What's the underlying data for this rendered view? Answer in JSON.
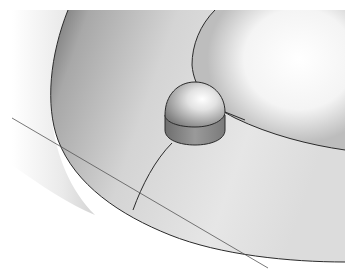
{
  "scene": {
    "description": "3D shaded render of a torus segment with a dome-capped cylinder knob",
    "colors": {
      "background": "#ffffff",
      "torus_light": "#f2f2f2",
      "torus_mid": "#c8c8c8",
      "torus_dark": "#8a8a8a",
      "edge_line": "#2a2a2a",
      "knob_highlight": "#fafafa",
      "knob_shadow": "#7a7a7a",
      "cylinder": "#8c8c8c"
    }
  }
}
